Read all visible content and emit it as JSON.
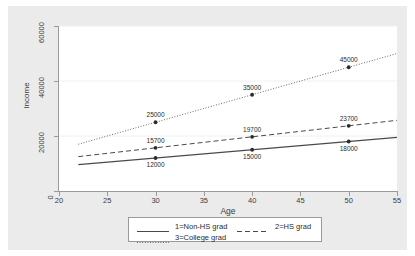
{
  "chart_data": {
    "type": "line",
    "title": "",
    "xlabel": "Age",
    "ylabel": "Income",
    "xlim": [
      20,
      55
    ],
    "ylim": [
      0,
      60000
    ],
    "xticks": [
      20,
      25,
      30,
      35,
      40,
      45,
      50,
      55
    ],
    "yticks": [
      0,
      20000,
      40000,
      60000
    ],
    "grid": "horizontal",
    "legend_position": "below-plot",
    "x": [
      30,
      40,
      50
    ],
    "series": [
      {
        "name": "1=Non-HS grad",
        "style": "solid",
        "values": [
          12000,
          15000,
          18000
        ],
        "labels": [
          "12000",
          "15000",
          "18000"
        ],
        "label_side": "below",
        "line_x": [
          22,
          55
        ],
        "line_y": [
          9600,
          19500
        ]
      },
      {
        "name": "2=HS grad",
        "style": "dashed",
        "values": [
          15700,
          19700,
          23700
        ],
        "labels": [
          "15700",
          "19700",
          "23700"
        ],
        "label_side": "above",
        "line_x": [
          22,
          55
        ],
        "line_y": [
          12500,
          25700
        ]
      },
      {
        "name": "3=College grad",
        "style": "dotted",
        "values": [
          25000,
          35000,
          45000
        ],
        "labels": [
          "25000",
          "35000",
          "45000"
        ],
        "label_side": "above",
        "line_x": [
          22,
          55
        ],
        "line_y": [
          17000,
          50000
        ]
      }
    ],
    "colors": {
      "line": "#4a4a4a",
      "axis": "#9a9a9a",
      "grid": "#f0f0f0",
      "plot_background": "#ffffff",
      "canvas_background": "#ebebeb",
      "text": "#3b3b3b"
    }
  },
  "axes": {
    "y_tick_labels": [
      "0",
      "20000",
      "40000",
      "60000"
    ],
    "x_tick_labels": [
      "20",
      "25",
      "30",
      "35",
      "40",
      "45",
      "50",
      "55"
    ],
    "y_title": "Income",
    "x_title": "Age"
  },
  "legend": {
    "entries": [
      {
        "label": "1=Non-HS grad",
        "style": "solid"
      },
      {
        "label": "2=HS grad",
        "style": "dashed"
      },
      {
        "label": "3=College grad",
        "style": "dotted"
      }
    ]
  },
  "point_labels": {
    "nonhs_30": "12000",
    "nonhs_40": "15000",
    "nonhs_50": "18000",
    "hs_30": "15700",
    "hs_40": "19700",
    "hs_50": "23700",
    "college_30": "25000",
    "college_40": "35000",
    "college_50": "45000"
  }
}
